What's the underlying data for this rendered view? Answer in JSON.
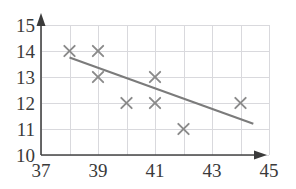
{
  "chart_data": {
    "type": "scatter",
    "title": "",
    "xlabel": "",
    "ylabel": "",
    "xlim": [
      37,
      45
    ],
    "ylim": [
      10,
      15
    ],
    "grid": true,
    "legend": null,
    "x_ticks": [
      37,
      39,
      41,
      43,
      45
    ],
    "y_ticks": [
      10,
      11,
      12,
      13,
      14,
      15
    ],
    "x_tick_labels": [
      "37",
      "39",
      "41",
      "43",
      "45"
    ],
    "y_tick_labels": [
      "10",
      "11",
      "12",
      "13",
      "14",
      "15"
    ],
    "x_gridlines": [
      37,
      38,
      39,
      40,
      41,
      42,
      43,
      44,
      45
    ],
    "y_gridlines": [
      10,
      11,
      12,
      13,
      14,
      15
    ],
    "marker_symbol": "x",
    "marker_color": "#8a8a8a",
    "axis_color": "#444444",
    "grid_color": "#d9d9dd",
    "points": [
      {
        "x": 38,
        "y": 14
      },
      {
        "x": 39,
        "y": 14
      },
      {
        "x": 39,
        "y": 13
      },
      {
        "x": 40,
        "y": 12
      },
      {
        "x": 41,
        "y": 13
      },
      {
        "x": 41,
        "y": 12
      },
      {
        "x": 42,
        "y": 11
      },
      {
        "x": 44,
        "y": 12
      }
    ],
    "trend_line": {
      "color": "#7b7b7b",
      "x_start": 38.0,
      "y_start": 13.75,
      "x_end": 44.45,
      "y_end": 11.2
    }
  }
}
